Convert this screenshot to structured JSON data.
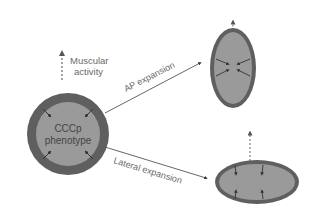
{
  "diagram": {
    "center_shape": {
      "label_line1": "CCCp",
      "label_line2": "phenotype",
      "shape": "circle"
    },
    "top_annotation": {
      "line1": "Muscular",
      "line2": "activity",
      "arrow": "dashed-up-arrow"
    },
    "branches": [
      {
        "label": "AP expansion",
        "result_shape": "vertical-ellipse"
      },
      {
        "label": "Lateral expansion",
        "result_shape": "horizontal-ellipse"
      }
    ],
    "colors": {
      "ring": "#5f5f5f",
      "fill": "#9a9a9a",
      "text": "#6a6a6a",
      "line": "#555555",
      "background": "#ffffff"
    }
  }
}
